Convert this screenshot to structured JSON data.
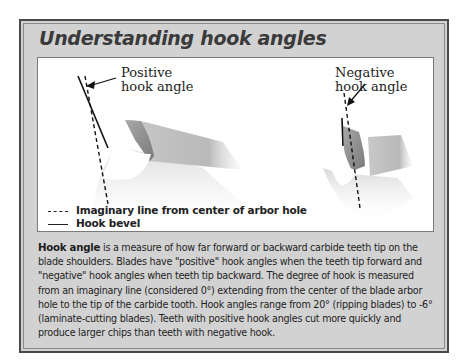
{
  "title": "Understanding hook angles",
  "diagram": {
    "positive_label_line1": "Positive",
    "positive_label_line2": "hook angle",
    "negative_label_line1": "Negative",
    "negative_label_line2": "hook angle",
    "legend": [
      {
        "style": "dashed",
        "label": "Imaginary line from center of arbor hole"
      },
      {
        "style": "solid",
        "label": "Hook bevel"
      }
    ]
  },
  "body": {
    "term": "Hook angle",
    "text": " is a measure of how far forward or backward carbide teeth tip on the blade shoulders. Blades have \"positive\" hook angles when the teeth tip forward and \"negative\" hook angles when teeth tip backward. The degree of hook is measured from an imaginary line (considered 0°) extending from the center of the blade arbor hole to the tip of the carbide tooth. Hook angles range from 20° (ripping blades) to -6° (laminate-cutting blades). Teeth with positive hook angles cut more quickly and produce larger chips than teeth with negative hook."
  },
  "colors": {
    "frame_bg": "#d2d2d2",
    "frame_border": "#4a4a4a",
    "title": "#3a3a3a",
    "tooth": "#8f8f8f"
  }
}
